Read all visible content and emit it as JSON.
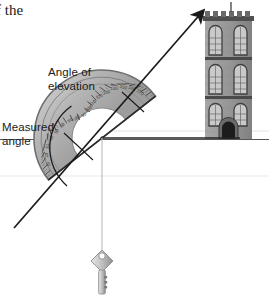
{
  "scene": {
    "title_fragment": "f the",
    "description": "Clinometer made from a protractor with a key on a string, used to measure the angle of elevation to the top of a tower"
  },
  "labels": {
    "angle_of_elevation": "Angle of\nelevation",
    "measured_angle": "Measured\nangle"
  },
  "colors": {
    "ink": "#1a1a1a",
    "protractor_body": "#b9b9b9",
    "protractor_edge": "#6e6e6e",
    "protractor_inner": "#d6d6d6",
    "tower_wall": "#9a9a9a",
    "tower_trim": "#4f4f4f",
    "tower_window": "#c9c9c9",
    "door_dark": "#1c1c1c",
    "ground_line": "#555555",
    "string": "#c2c2c2",
    "key_body": "#bdbdbd",
    "faint_rule": "#dcdcdc"
  },
  "protractor": {
    "center_x": 102,
    "center_y": 138,
    "outer_radius": 68,
    "inner_radius": 30,
    "baseline_rotation_deg": -38,
    "tick_count": 36,
    "scale_numerals": [
      "10",
      "20",
      "30",
      "40",
      "50",
      "60",
      "70",
      "80",
      "90",
      "100",
      "110",
      "120",
      "130",
      "140",
      "150",
      "160",
      "170"
    ]
  },
  "sight_line": {
    "from_x": 14,
    "from_y": 228,
    "to_x": 206,
    "to_y": 8,
    "has_arrowhead": true
  },
  "plumb": {
    "string_top_x": 102,
    "string_top_y": 138,
    "string_bottom_y": 248,
    "weight": "key"
  },
  "tower": {
    "left": 205,
    "right": 252,
    "top": 14,
    "base": 139,
    "floors": 3,
    "windows_per_floor": 2,
    "has_battlements": true,
    "has_flagpole": true,
    "has_door": true
  },
  "ground": {
    "y": 139,
    "x_start": 0,
    "x_end": 269
  },
  "horizontal_reference": {
    "y": 138,
    "x_start": 100,
    "x_end": 240
  }
}
